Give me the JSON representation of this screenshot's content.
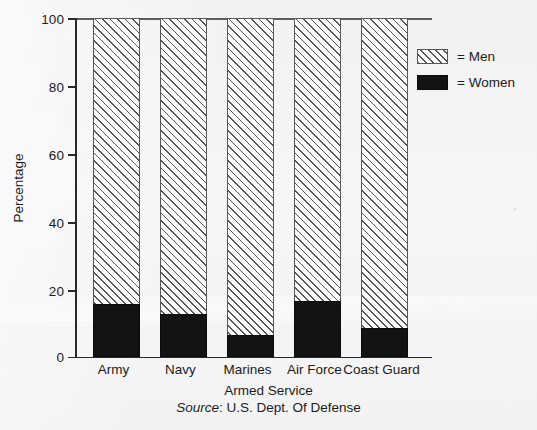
{
  "chart_data": {
    "type": "bar",
    "subtype": "stacked-percentage",
    "title": "",
    "xlabel": "Armed Service",
    "ylabel": "Percentage",
    "categories": [
      "Army",
      "Navy",
      "Marines",
      "Air Force",
      "Coast Guard"
    ],
    "series": [
      {
        "name": "Women",
        "values": [
          15.5,
          12.5,
          6.5,
          16.5,
          8.5
        ]
      },
      {
        "name": "Men",
        "values": [
          84.5,
          87.5,
          93.5,
          83.5,
          91.5
        ]
      }
    ],
    "ylim": [
      0,
      100
    ],
    "yticks": [
      0,
      20,
      40,
      60,
      80,
      100
    ],
    "ytick_labels": [
      "0",
      "20",
      "40",
      "60",
      "80",
      "100"
    ],
    "grid": false,
    "legend_position": "right",
    "legend": [
      {
        "label": "= Men",
        "swatch": "diagonal-hatch"
      },
      {
        "label": "= Women",
        "swatch": "solid-black"
      }
    ],
    "source_prefix": "Source",
    "source_separator": ": ",
    "source_text": "U.S. Dept. Of Defense",
    "colors": {
      "women": "#131313",
      "men_fill": "#fdfdfd",
      "men_hatch": "#555555",
      "axis": "#2a2a2a",
      "background": "#f4f4f4"
    }
  }
}
